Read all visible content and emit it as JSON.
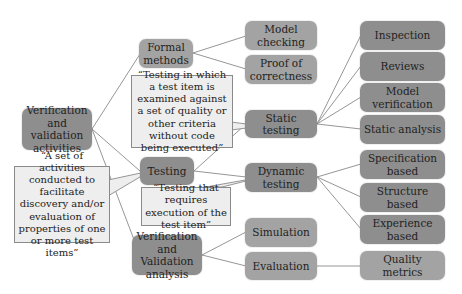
{
  "diagram": {
    "type": "mind-map",
    "colors": {
      "dark_node": "#8e8e8e",
      "mid_node": "#a3a3a3",
      "callout_fill": "#eeeeee",
      "callout_border": "#8a8a8a",
      "edge": "#8a8a8a",
      "text": "#1f1f1f"
    },
    "root": {
      "label": "Verification and validation activities"
    },
    "level1": [
      {
        "id": "formal",
        "label": "Formal methods"
      },
      {
        "id": "testing",
        "label": "Testing"
      },
      {
        "id": "vva",
        "label": "Verification and Validation analysis"
      }
    ],
    "level2": [
      {
        "id": "model_checking",
        "label": "Model checking",
        "parent": "formal"
      },
      {
        "id": "proof",
        "label": "Proof of correctness",
        "parent": "formal"
      },
      {
        "id": "static",
        "label": "Static testing",
        "parent": "testing"
      },
      {
        "id": "dynamic",
        "label": "Dynamic testing",
        "parent": "testing"
      },
      {
        "id": "simulation",
        "label": "Simulation",
        "parent": "vva"
      },
      {
        "id": "evaluation",
        "label": "Evaluation",
        "parent": "vva"
      }
    ],
    "level3": [
      {
        "id": "inspection",
        "label": "Inspection",
        "parent": "static"
      },
      {
        "id": "reviews",
        "label": "Reviews",
        "parent": "static"
      },
      {
        "id": "model_verification",
        "label": "Model verification",
        "parent": "static"
      },
      {
        "id": "static_analysis",
        "label": "Static analysis",
        "parent": "static"
      },
      {
        "id": "spec_based",
        "label": "Specification based",
        "parent": "dynamic"
      },
      {
        "id": "structure_based",
        "label": "Structure based",
        "parent": "dynamic"
      },
      {
        "id": "experience_based",
        "label": "Experience based",
        "parent": "dynamic"
      },
      {
        "id": "quality_metrics",
        "label": "Quality metrics",
        "parent": "evaluation"
      }
    ],
    "callouts": [
      {
        "id": "static_def",
        "target": "static",
        "text": "“Testing in which a test item is examined against a set of quality or other criteria without code being executed”"
      },
      {
        "id": "testing_def",
        "target": "testing",
        "text": "“A set of activities conducted to facilitate discovery and/or evaluation of properties of one or more test items”"
      },
      {
        "id": "dynamic_def",
        "target": "dynamic",
        "text": "“Testing that requires execution of the test item”"
      }
    ]
  }
}
